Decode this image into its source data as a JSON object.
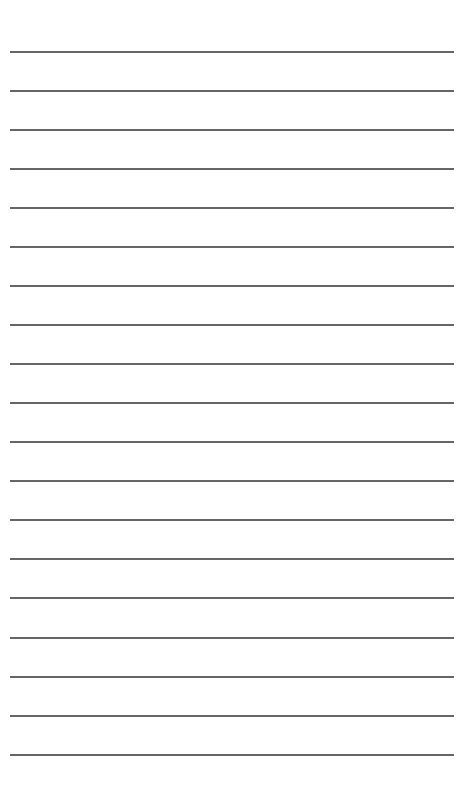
{
  "page": {
    "type": "lined-paper",
    "background_color": "#ffffff",
    "line_color": "#555555",
    "line_count": 19,
    "line_left": 10,
    "line_width": 444,
    "line_thickness": 2,
    "lines_y": [
      51,
      90,
      129,
      168,
      207,
      246,
      285,
      324,
      363,
      402,
      441,
      480,
      519,
      558,
      597,
      637,
      676,
      715,
      754
    ]
  }
}
